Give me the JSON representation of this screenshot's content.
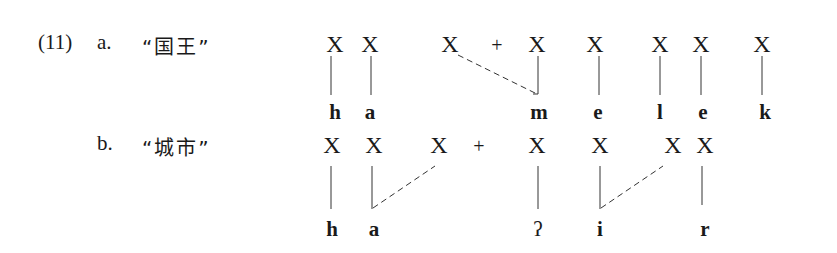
{
  "example": {
    "number": "(11)",
    "a": {
      "marker": "a.",
      "gloss": "“国王”",
      "skeleton": [
        {
          "label": "X",
          "x": 335
        },
        {
          "label": "X",
          "x": 370
        },
        {
          "label": "X",
          "x": 450
        },
        {
          "label": "X",
          "x": 537
        },
        {
          "label": "X",
          "x": 595
        },
        {
          "label": "X",
          "x": 660
        },
        {
          "label": "X",
          "x": 701
        },
        {
          "label": "X",
          "x": 762
        }
      ],
      "plus": {
        "label": "+",
        "x": 497
      },
      "segments": [
        {
          "label": "h",
          "x": 335
        },
        {
          "label": "a",
          "x": 370
        },
        {
          "label": "m",
          "x": 539
        },
        {
          "label": "e",
          "x": 598
        },
        {
          "label": "l",
          "x": 660
        },
        {
          "label": "e",
          "x": 703
        },
        {
          "label": "k",
          "x": 765
        }
      ]
    },
    "b": {
      "marker": "b.",
      "gloss": "“城市”",
      "skeleton": [
        {
          "label": "X",
          "x": 332
        },
        {
          "label": "X",
          "x": 374
        },
        {
          "label": "X",
          "x": 439
        },
        {
          "label": "X",
          "x": 537
        },
        {
          "label": "X",
          "x": 600
        },
        {
          "label": "X",
          "x": 673
        },
        {
          "label": "X",
          "x": 705
        }
      ],
      "plus": {
        "label": "+",
        "x": 479
      },
      "segments": [
        {
          "label": "h",
          "x": 332
        },
        {
          "label": "a",
          "x": 374
        },
        {
          "label": "ʔ",
          "x": 537
        },
        {
          "label": "i",
          "x": 600
        },
        {
          "label": "r",
          "x": 705
        }
      ]
    }
  }
}
